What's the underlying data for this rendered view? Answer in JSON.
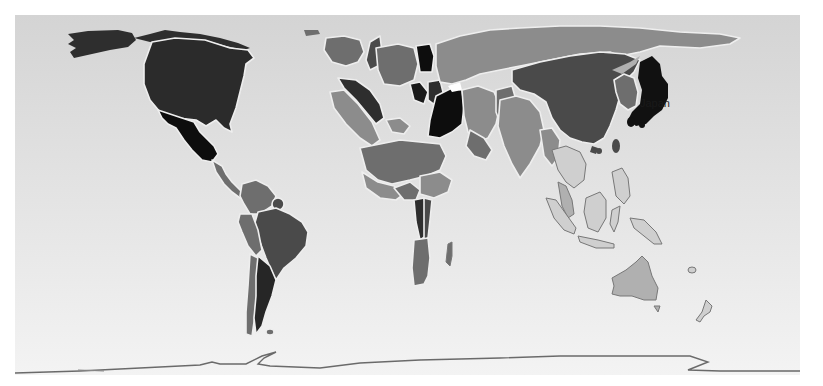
{
  "map": {
    "type": "cartogram",
    "projection": "world",
    "colormode": "grayscale",
    "background": {
      "top": "#d6d6d6",
      "bottom": "#f2f2f2"
    },
    "frame": {
      "x": 15,
      "y": 15,
      "width": 785,
      "height": 360
    },
    "labels": [
      {
        "text": "Japan",
        "x": 640,
        "y": 104
      }
    ],
    "shades": {
      "darkest": "#0d0d0d",
      "dark": "#2e2e2e",
      "mid_dark": "#4a4a4a",
      "mid": "#6e6e6e",
      "mid_light": "#8c8c8c",
      "light": "#b0b0b0",
      "lightest": "#cfcfcf",
      "border": "#f0f0f0",
      "outline": "#666666"
    },
    "regions": [
      {
        "name": "Alaska",
        "shade": "dark"
      },
      {
        "name": "Canada",
        "shade": "dark"
      },
      {
        "name": "United States",
        "shade": "dark"
      },
      {
        "name": "Mexico",
        "shade": "darkest"
      },
      {
        "name": "Central America",
        "shade": "mid"
      },
      {
        "name": "Colombia/Venezuela",
        "shade": "mid"
      },
      {
        "name": "Brazil",
        "shade": "mid_dark"
      },
      {
        "name": "Peru/Bolivia",
        "shade": "mid"
      },
      {
        "name": "Chile",
        "shade": "mid"
      },
      {
        "name": "Argentina",
        "shade": "dark"
      },
      {
        "name": "Europe",
        "shade": "mid"
      },
      {
        "name": "Africa",
        "shade": "mid"
      },
      {
        "name": "South Africa",
        "shade": "mid"
      },
      {
        "name": "Madagascar",
        "shade": "mid"
      },
      {
        "name": "Russia",
        "shade": "mid_light"
      },
      {
        "name": "Middle East",
        "shade": "mid_light"
      },
      {
        "name": "India",
        "shade": "mid_light"
      },
      {
        "name": "China",
        "shade": "mid_dark"
      },
      {
        "name": "Korea",
        "shade": "mid"
      },
      {
        "name": "Japan",
        "shade": "darkest"
      },
      {
        "name": "Southeast Asia",
        "shade": "lightest"
      },
      {
        "name": "Indonesia",
        "shade": "lightest"
      },
      {
        "name": "Australia",
        "shade": "light"
      },
      {
        "name": "New Zealand",
        "shade": "lightest"
      },
      {
        "name": "Antarctica",
        "shade": "outline"
      }
    ]
  }
}
